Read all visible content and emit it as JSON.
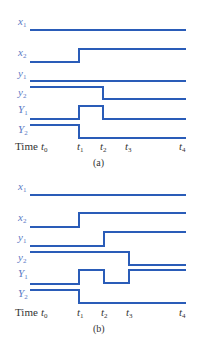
{
  "colors": {
    "signal": "#2a5cb8",
    "label": "#5a79c4",
    "text": "#333333"
  },
  "diagrams": [
    {
      "caption": "(a)",
      "signals": [
        {
          "name": "x",
          "sub": "1",
          "case": "lower"
        },
        {
          "name": "x",
          "sub": "2",
          "case": "lower"
        },
        {
          "name": "y",
          "sub": "1",
          "case": "lower"
        },
        {
          "name": "y",
          "sub": "2",
          "case": "lower"
        },
        {
          "name": "Y",
          "sub": "1",
          "case": "upper"
        },
        {
          "name": "Y",
          "sub": "2",
          "case": "upper"
        }
      ],
      "time_label": "Time",
      "ticks": [
        {
          "t": "t",
          "sub": "0"
        },
        {
          "t": "t",
          "sub": "1"
        },
        {
          "t": "t",
          "sub": "2"
        },
        {
          "t": "t",
          "sub": "3"
        },
        {
          "t": "t",
          "sub": "4"
        }
      ],
      "waveforms": {
        "x1": "constant high",
        "x2": "low until t1, then high",
        "y1": "constant",
        "y2": "high until t2, then low",
        "Y1": "low, high from t1 to t2, then low",
        "Y2": "high until t1, then low"
      }
    },
    {
      "caption": "(b)",
      "signals": [
        {
          "name": "x",
          "sub": "1",
          "case": "lower"
        },
        {
          "name": "x",
          "sub": "2",
          "case": "lower"
        },
        {
          "name": "y",
          "sub": "1",
          "case": "lower"
        },
        {
          "name": "y",
          "sub": "2",
          "case": "lower"
        },
        {
          "name": "Y",
          "sub": "1",
          "case": "upper"
        },
        {
          "name": "Y",
          "sub": "2",
          "case": "upper"
        }
      ],
      "time_label": "Time",
      "ticks": [
        {
          "t": "t",
          "sub": "0"
        },
        {
          "t": "t",
          "sub": "1"
        },
        {
          "t": "t",
          "sub": "2"
        },
        {
          "t": "t",
          "sub": "3"
        },
        {
          "t": "t",
          "sub": "4"
        }
      ],
      "waveforms": {
        "x1": "constant",
        "x2": "low until t1, then high",
        "y1": "low until t2, then high",
        "y2": "high until t3, then low",
        "Y1": "low, high t1-t2, low t2-t3, high after t3",
        "Y2": "high until t1, then low"
      }
    }
  ]
}
